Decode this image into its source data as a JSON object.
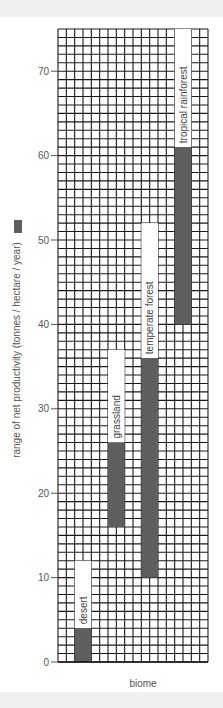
{
  "chart_data": {
    "type": "bar",
    "subtype": "floating-range",
    "title": "",
    "xlabel": "biome",
    "ylabel": "range of net productivity (tonnes / hectare / year)",
    "ylim": [
      0,
      75
    ],
    "yticks": [
      0,
      10,
      20,
      30,
      40,
      50,
      60,
      70
    ],
    "grid": true,
    "legend": {
      "swatch_color": "#5e5e5e",
      "position": "inline-with-ylabel"
    },
    "categories": [
      "desert",
      "grassland",
      "temperate forest",
      "tropical rainforest"
    ],
    "series": [
      {
        "name": "range of net productivity",
        "low": [
          0,
          16,
          10,
          40
        ],
        "high": [
          4,
          26,
          36,
          61
        ]
      }
    ],
    "label_box_top": [
      12,
      37,
      52,
      75
    ]
  },
  "colors": {
    "bar": "#5e5e5e",
    "grid": "#1a1a1a",
    "background": "#ffffff",
    "band": "#f0f0f0",
    "text": "#555555"
  }
}
